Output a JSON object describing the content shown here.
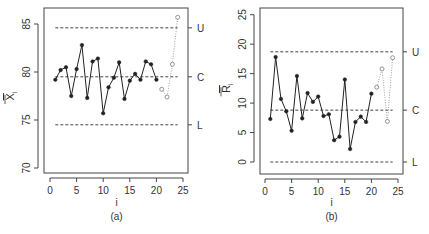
{
  "chart_data": [
    {
      "type": "line",
      "panel_label": "(a)",
      "title": "",
      "xlabel": "i",
      "ylabel": "X̅ᵢ",
      "ylabel_main": "X",
      "ylabel_sub": "i",
      "xlim": [
        0,
        25
      ],
      "ylim": [
        70,
        85
      ],
      "xticks": [
        0,
        5,
        10,
        15,
        20,
        25
      ],
      "yticks": [
        70,
        75,
        80,
        85
      ],
      "grid": false,
      "control_lines": [
        {
          "name": "U",
          "value": 84.6
        },
        {
          "name": "C",
          "value": 79.5
        },
        {
          "name": "L",
          "value": 74.5
        }
      ],
      "series": [
        {
          "name": "phase-1",
          "style": "solid-filled",
          "x": [
            1,
            2,
            3,
            4,
            5,
            6,
            7,
            8,
            9,
            10,
            11,
            12,
            13,
            14,
            15,
            16,
            17,
            18,
            19,
            20
          ],
          "values": [
            79.2,
            80.2,
            80.5,
            77.5,
            80.3,
            82.8,
            77.3,
            81.1,
            81.4,
            75.7,
            78.4,
            79.4,
            81.0,
            77.2,
            79.1,
            79.8,
            79.2,
            81.1,
            80.8,
            79.2
          ]
        },
        {
          "name": "phase-2",
          "style": "dotted-open",
          "x": [
            21,
            22,
            23,
            24
          ],
          "values": [
            78.2,
            77.4,
            80.8,
            85.7
          ]
        }
      ]
    },
    {
      "type": "line",
      "panel_label": "(b)",
      "title": "",
      "xlabel": "i",
      "ylabel": "R̅ᵢ",
      "ylabel_main": "R",
      "ylabel_sub": "i",
      "xlim": [
        0,
        25
      ],
      "ylim": [
        0,
        25
      ],
      "xticks": [
        0,
        5,
        10,
        15,
        20,
        25
      ],
      "yticks": [
        0,
        5,
        10,
        15,
        20,
        25
      ],
      "grid": false,
      "control_lines": [
        {
          "name": "U",
          "value": 18.7
        },
        {
          "name": "C",
          "value": 8.8
        },
        {
          "name": "L",
          "value": 0
        }
      ],
      "series": [
        {
          "name": "phase-1",
          "style": "solid-filled",
          "x": [
            1,
            2,
            3,
            4,
            5,
            6,
            7,
            8,
            9,
            10,
            11,
            12,
            13,
            14,
            15,
            16,
            17,
            18,
            19,
            20
          ],
          "values": [
            7.3,
            17.8,
            10.7,
            8.6,
            5.3,
            14.6,
            7.4,
            11.7,
            10.2,
            11.1,
            7.8,
            8.1,
            3.7,
            4.3,
            14.0,
            2.2,
            6.8,
            7.7,
            6.8,
            11.6
          ]
        },
        {
          "name": "phase-2",
          "style": "dotted-open",
          "x": [
            21,
            22,
            23,
            24
          ],
          "values": [
            12.7,
            15.8,
            6.9,
            17.7
          ]
        }
      ]
    }
  ],
  "colors": {
    "axis": "#444444",
    "line": "#222222",
    "control_line": "#444444",
    "phase2": "#888888"
  }
}
